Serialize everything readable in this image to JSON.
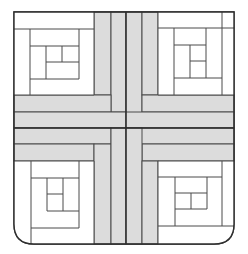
{
  "diagram": {
    "type": "quilt-block",
    "pattern": "log-cabin-with-woven-cross-strips",
    "canvas": {
      "width": 248,
      "height": 254
    },
    "colors": {
      "background": "#ffffff",
      "outline": "#3a3a3a",
      "strip_fill": "#dcdcdc",
      "seam": "#4a4a4a",
      "block_fill": "#ffffff"
    },
    "outline": {
      "x": 14,
      "y": 12,
      "width": 220,
      "height": 232,
      "bottom_corner_radius": 20
    },
    "cross_strips": {
      "vertical_lines_x": [
        94,
        111,
        126,
        142,
        158
      ],
      "horizontal_lines_y": [
        95,
        112,
        128,
        144,
        161
      ]
    },
    "log_cabin_blocks": [
      {
        "position": "top-left"
      },
      {
        "position": "top-right"
      },
      {
        "position": "bottom-left"
      },
      {
        "position": "bottom-right"
      }
    ]
  }
}
